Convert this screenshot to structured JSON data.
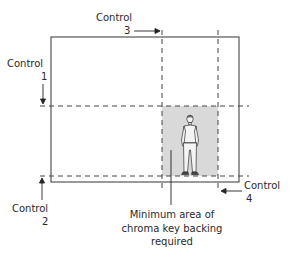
{
  "diagram": {
    "type": "chroma-key framing diagram",
    "colors": {
      "frame": "#555555",
      "dashed": "#444444",
      "shaded_area": "#d9d9d9",
      "text": "#2a2a2a"
    },
    "controls": [
      {
        "id": "control-1",
        "label": "Control",
        "number": "1",
        "arrow_direction": "down",
        "marks": "upper horizontal dashed line"
      },
      {
        "id": "control-2",
        "label": "Control",
        "number": "2",
        "arrow_direction": "up",
        "marks": "lower horizontal dashed line"
      },
      {
        "id": "control-3",
        "label": "Control",
        "number": "3",
        "arrow_direction": "right",
        "marks": "left vertical dashed line"
      },
      {
        "id": "control-4",
        "label": "Control",
        "number": "4",
        "arrow_direction": "left",
        "marks": "right vertical dashed line"
      }
    ],
    "caption": {
      "line1": "Minimum area of",
      "line2": "chroma key backing",
      "line3": "required"
    },
    "figure": "standing person"
  }
}
